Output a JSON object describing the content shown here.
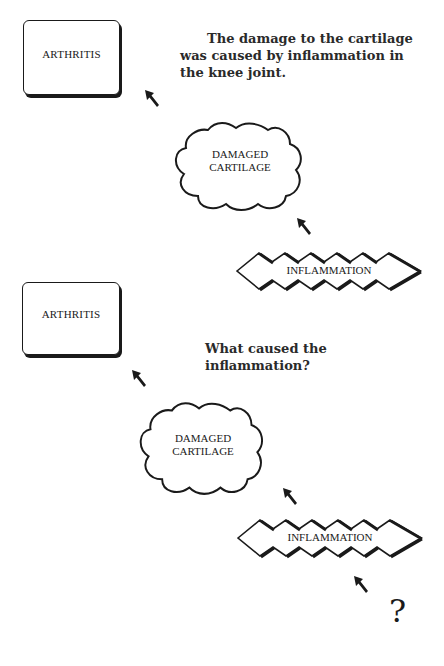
{
  "panels": [
    {
      "box_label": "ARTHRITIS",
      "cloud_label_line1": "DAMAGED",
      "cloud_label_line2": "CARTILAGE",
      "zigzag_label": "INFLAMMATION",
      "caption": "The damage to the cartilage was caused by inflammation in the knee joint."
    },
    {
      "box_label": "ARTHRITIS",
      "cloud_label_line1": "DAMAGED",
      "cloud_label_line2": "CARTILAGE",
      "zigzag_label": "INFLAMMATION",
      "caption": "What caused the inflammation?",
      "unknown_cause": "?"
    }
  ],
  "icons": {
    "arrow": "arrow-up-left-icon"
  },
  "colors": {
    "ink": "#1a1a1a",
    "background": "#ffffff"
  }
}
